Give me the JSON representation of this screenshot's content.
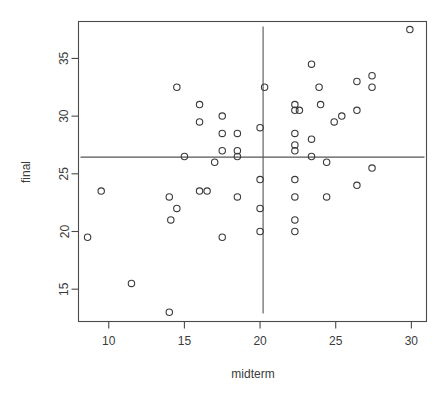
{
  "chart_data": {
    "type": "scatter",
    "title": "",
    "xlabel": "midterm",
    "ylabel": "final",
    "xlim": [
      8.0,
      31.0
    ],
    "ylim": [
      12.2,
      38.2
    ],
    "xticks": [
      10,
      15,
      20,
      25,
      30
    ],
    "yticks": [
      15,
      20,
      25,
      30,
      35
    ],
    "xtick_labels": [
      "10",
      "15",
      "20",
      "25",
      "30"
    ],
    "ytick_labels": [
      "15",
      "20",
      "25",
      "30",
      "35"
    ],
    "grid": false,
    "legend": null,
    "marker": "open-circle",
    "point_color": "#3a3a3a",
    "annotations": [
      {
        "type": "vline",
        "name": "midterm-mean-line",
        "x": 20.2,
        "color": "#555555"
      },
      {
        "type": "hline",
        "name": "final-mean-line",
        "y": 26.45,
        "color": "#555555"
      }
    ],
    "points": [
      {
        "x": 8.6,
        "y": 19.5
      },
      {
        "x": 9.5,
        "y": 23.5
      },
      {
        "x": 11.5,
        "y": 15.5
      },
      {
        "x": 14.0,
        "y": 13.0
      },
      {
        "x": 14.0,
        "y": 23.0
      },
      {
        "x": 14.1,
        "y": 21.0
      },
      {
        "x": 14.5,
        "y": 22.0
      },
      {
        "x": 14.5,
        "y": 32.5
      },
      {
        "x": 15.0,
        "y": 26.5
      },
      {
        "x": 16.0,
        "y": 31.0
      },
      {
        "x": 16.0,
        "y": 29.5
      },
      {
        "x": 16.0,
        "y": 23.5
      },
      {
        "x": 16.5,
        "y": 23.5
      },
      {
        "x": 17.0,
        "y": 26.0
      },
      {
        "x": 17.5,
        "y": 30.0
      },
      {
        "x": 17.5,
        "y": 28.5
      },
      {
        "x": 17.5,
        "y": 27.0
      },
      {
        "x": 17.5,
        "y": 19.5
      },
      {
        "x": 18.5,
        "y": 28.5
      },
      {
        "x": 18.5,
        "y": 27.0
      },
      {
        "x": 18.5,
        "y": 26.5
      },
      {
        "x": 18.5,
        "y": 23.0
      },
      {
        "x": 20.0,
        "y": 29.0
      },
      {
        "x": 20.0,
        "y": 24.5
      },
      {
        "x": 20.0,
        "y": 22.0
      },
      {
        "x": 20.0,
        "y": 20.0
      },
      {
        "x": 20.3,
        "y": 32.5
      },
      {
        "x": 22.3,
        "y": 31.0
      },
      {
        "x": 22.3,
        "y": 30.5
      },
      {
        "x": 22.6,
        "y": 30.5
      },
      {
        "x": 22.3,
        "y": 28.5
      },
      {
        "x": 22.3,
        "y": 27.5
      },
      {
        "x": 22.3,
        "y": 27.0
      },
      {
        "x": 22.3,
        "y": 24.5
      },
      {
        "x": 22.3,
        "y": 23.0
      },
      {
        "x": 22.3,
        "y": 21.0
      },
      {
        "x": 22.3,
        "y": 20.0
      },
      {
        "x": 23.4,
        "y": 34.5
      },
      {
        "x": 23.4,
        "y": 28.0
      },
      {
        "x": 23.4,
        "y": 26.5
      },
      {
        "x": 23.9,
        "y": 32.5
      },
      {
        "x": 24.0,
        "y": 31.0
      },
      {
        "x": 24.4,
        "y": 26.0
      },
      {
        "x": 24.4,
        "y": 23.0
      },
      {
        "x": 24.9,
        "y": 29.5
      },
      {
        "x": 25.4,
        "y": 30.0
      },
      {
        "x": 26.4,
        "y": 33.0
      },
      {
        "x": 26.4,
        "y": 30.5
      },
      {
        "x": 26.4,
        "y": 24.0
      },
      {
        "x": 27.4,
        "y": 33.5
      },
      {
        "x": 27.4,
        "y": 32.5
      },
      {
        "x": 27.4,
        "y": 25.5
      },
      {
        "x": 29.9,
        "y": 37.5
      }
    ]
  }
}
